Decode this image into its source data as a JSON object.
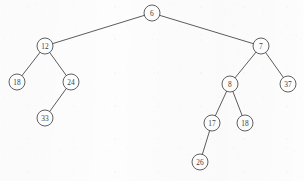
{
  "figure": {
    "type": "binary-tree",
    "width": 304,
    "height": 181,
    "background_color": "#fdfdfd",
    "stroke_color": "#4a4a4a",
    "node_fill_color": "#ffffff",
    "node_radius": 8
  },
  "chart_data": {
    "type": "diagram",
    "subtype": "binary-tree",
    "root": "n-root",
    "nodes": [
      {
        "id": "n-root",
        "label": "6",
        "x": 152,
        "y": 13,
        "depth": 0,
        "parent": null,
        "side": "root"
      },
      {
        "id": "n-12",
        "label": "12",
        "x": 45,
        "y": 46,
        "depth": 1,
        "parent": "n-root",
        "side": "left"
      },
      {
        "id": "n-7",
        "label": "7",
        "x": 261,
        "y": 46,
        "depth": 1,
        "parent": "n-root",
        "side": "right"
      },
      {
        "id": "n-18l",
        "label": "18",
        "x": 17,
        "y": 82,
        "depth": 2,
        "parent": "n-12",
        "side": "left"
      },
      {
        "id": "n-24",
        "label": "24",
        "x": 71,
        "y": 82,
        "depth": 2,
        "parent": "n-12",
        "side": "right"
      },
      {
        "id": "n-33",
        "label": "33",
        "x": 45,
        "y": 118,
        "depth": 3,
        "parent": "n-24",
        "side": "left"
      },
      {
        "id": "n-8",
        "label": "8",
        "x": 230,
        "y": 84,
        "depth": 2,
        "parent": "n-7",
        "side": "left"
      },
      {
        "id": "n-37",
        "label": "37",
        "x": 288,
        "y": 84,
        "depth": 2,
        "parent": "n-7",
        "side": "right"
      },
      {
        "id": "n-17",
        "label": "17",
        "x": 212,
        "y": 123,
        "depth": 3,
        "parent": "n-8",
        "side": "left"
      },
      {
        "id": "n-18r",
        "label": "18",
        "x": 245,
        "y": 123,
        "depth": 3,
        "parent": "n-8",
        "side": "right"
      },
      {
        "id": "n-26",
        "label": "26",
        "x": 200,
        "y": 162,
        "depth": 4,
        "parent": "n-17",
        "side": "left"
      }
    ],
    "edges": [
      {
        "from": "n-root",
        "to": "n-12"
      },
      {
        "from": "n-root",
        "to": "n-7"
      },
      {
        "from": "n-12",
        "to": "n-18l"
      },
      {
        "from": "n-12",
        "to": "n-24"
      },
      {
        "from": "n-24",
        "to": "n-33"
      },
      {
        "from": "n-7",
        "to": "n-8"
      },
      {
        "from": "n-7",
        "to": "n-37"
      },
      {
        "from": "n-8",
        "to": "n-17"
      },
      {
        "from": "n-8",
        "to": "n-18r"
      },
      {
        "from": "n-17",
        "to": "n-26"
      }
    ],
    "values": [
      "6",
      "12",
      "7",
      "18",
      "24",
      "33",
      "8",
      "37",
      "17",
      "18",
      "26"
    ]
  }
}
